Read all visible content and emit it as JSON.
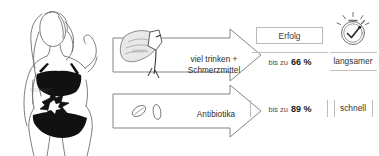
{
  "diagram": {
    "title_visible": false,
    "illustration": {
      "subject": "female-torso-line-drawing",
      "garments": [
        "black-bra",
        "black-briefs"
      ],
      "pain_marker": "starburst-over-bladder",
      "faint_anatomical_label": ""
    },
    "columns": {
      "success_header": "Erfolg",
      "speed_header": ""
    },
    "rows": [
      {
        "id": "row-hydration",
        "treatment_label_line1": "viel trinken +",
        "treatment_label_line2": "Schmerzmittel",
        "icon": "hand-holding-glass-icon",
        "success_lead": "bis zu",
        "success_value": "66 %",
        "speed": "langsamer"
      },
      {
        "id": "row-antibiotics",
        "treatment_label_line1": "Antibiotika",
        "treatment_label_line2": "",
        "icon": "pills-icon",
        "success_lead": "bis zu",
        "success_value": "89 %",
        "speed": "schnell"
      }
    ],
    "stopwatch_icon": "stopwatch-check-icon",
    "colors": {
      "ink": "#2b2b2b",
      "rule": "#c2c2c2",
      "fill_black": "#111111",
      "paper": "#ffffff"
    }
  }
}
